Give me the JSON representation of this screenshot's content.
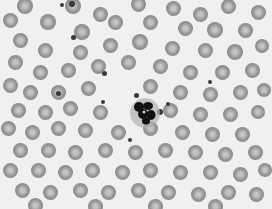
{
  "image": {
    "description": "Grayscale light micrograph of a peripheral blood smear showing many red blood cells with central pallor, a single neutrophil with a dark multi-lobed nucleus near the center, and scattered small dark platelets.",
    "background_color": "#f0f0f0",
    "cell_color": "#9a9a9a",
    "nucleus_color": "#111111"
  },
  "cells": {
    "rbc": [
      [
        25,
        6,
        16
      ],
      [
        73,
        6,
        16
      ],
      [
        100,
        14,
        15
      ],
      [
        138,
        4,
        15
      ],
      [
        173,
        8,
        15
      ],
      [
        200,
        14,
        15
      ],
      [
        228,
        6,
        15
      ],
      [
        258,
        12,
        15
      ],
      [
        10,
        20,
        15
      ],
      [
        48,
        22,
        16
      ],
      [
        82,
        32,
        16
      ],
      [
        115,
        22,
        15
      ],
      [
        150,
        22,
        15
      ],
      [
        185,
        28,
        15
      ],
      [
        215,
        30,
        16
      ],
      [
        245,
        30,
        15
      ],
      [
        20,
        40,
        15
      ],
      [
        45,
        50,
        15
      ],
      [
        80,
        52,
        15
      ],
      [
        110,
        45,
        15
      ],
      [
        140,
        42,
        16
      ],
      [
        172,
        48,
        15
      ],
      [
        205,
        50,
        15
      ],
      [
        235,
        52,
        16
      ],
      [
        262,
        46,
        14
      ],
      [
        15,
        62,
        15
      ],
      [
        40,
        72,
        15
      ],
      [
        68,
        70,
        15
      ],
      [
        98,
        66,
        15
      ],
      [
        128,
        62,
        15
      ],
      [
        160,
        66,
        15
      ],
      [
        190,
        72,
        15
      ],
      [
        222,
        72,
        15
      ],
      [
        252,
        70,
        15
      ],
      [
        10,
        85,
        15
      ],
      [
        30,
        92,
        15
      ],
      [
        58,
        92,
        15
      ],
      [
        88,
        88,
        15
      ],
      [
        150,
        86,
        15
      ],
      [
        180,
        92,
        15
      ],
      [
        210,
        94,
        15
      ],
      [
        240,
        92,
        15
      ],
      [
        264,
        90,
        14
      ],
      [
        18,
        110,
        15
      ],
      [
        45,
        112,
        15
      ],
      [
        70,
        108,
        15
      ],
      [
        100,
        112,
        15
      ],
      [
        170,
        110,
        15
      ],
      [
        200,
        114,
        15
      ],
      [
        230,
        114,
        15
      ],
      [
        258,
        112,
        14
      ],
      [
        8,
        128,
        15
      ],
      [
        32,
        132,
        15
      ],
      [
        58,
        128,
        15
      ],
      [
        85,
        130,
        15
      ],
      [
        118,
        132,
        15
      ],
      [
        150,
        128,
        15
      ],
      [
        182,
        132,
        15
      ],
      [
        212,
        134,
        15
      ],
      [
        242,
        134,
        15
      ],
      [
        20,
        150,
        15
      ],
      [
        48,
        150,
        15
      ],
      [
        75,
        152,
        15
      ],
      [
        105,
        150,
        15
      ],
      [
        135,
        152,
        15
      ],
      [
        165,
        150,
        15
      ],
      [
        195,
        152,
        15
      ],
      [
        225,
        154,
        15
      ],
      [
        255,
        152,
        15
      ],
      [
        10,
        170,
        15
      ],
      [
        38,
        170,
        15
      ],
      [
        65,
        172,
        15
      ],
      [
        92,
        170,
        15
      ],
      [
        122,
        172,
        15
      ],
      [
        150,
        170,
        15
      ],
      [
        180,
        172,
        15
      ],
      [
        210,
        172,
        15
      ],
      [
        240,
        174,
        15
      ],
      [
        265,
        170,
        14
      ],
      [
        22,
        190,
        15
      ],
      [
        50,
        192,
        15
      ],
      [
        80,
        190,
        15
      ],
      [
        108,
        192,
        15
      ],
      [
        138,
        190,
        15
      ],
      [
        168,
        192,
        15
      ],
      [
        198,
        194,
        15
      ],
      [
        228,
        192,
        15
      ],
      [
        256,
        194,
        15
      ],
      [
        35,
        205,
        15
      ],
      [
        95,
        206,
        15
      ],
      [
        155,
        206,
        15
      ],
      [
        215,
        206,
        15
      ]
    ],
    "platelets": [
      [
        72,
        4,
        3
      ],
      [
        73,
        37,
        2.5
      ],
      [
        104,
        73,
        2.5
      ],
      [
        103,
        102,
        2
      ],
      [
        136,
        95,
        2.5
      ],
      [
        160,
        112,
        3
      ],
      [
        168,
        104,
        2
      ],
      [
        58,
        93,
        2.5
      ],
      [
        130,
        140,
        2
      ],
      [
        210,
        82,
        2
      ],
      [
        62,
        5,
        2
      ]
    ],
    "wbc": {
      "x": 145,
      "y": 113,
      "label": "neutrophil"
    }
  }
}
